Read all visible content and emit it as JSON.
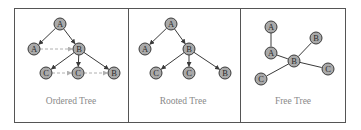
{
  "diagram": {
    "panels": [
      {
        "id": "ordered",
        "title": "Ordered Tree",
        "nodes": [
          {
            "label": "A",
            "x": 60,
            "y": 24
          },
          {
            "label": "A",
            "x": 34,
            "y": 49
          },
          {
            "label": "B",
            "x": 79,
            "y": 49
          },
          {
            "label": "C",
            "x": 46,
            "y": 73
          },
          {
            "label": "C",
            "x": 78,
            "y": 73
          },
          {
            "label": "B",
            "x": 114,
            "y": 73
          }
        ],
        "edges": [
          {
            "from": 0,
            "to": 1,
            "style": "arrow"
          },
          {
            "from": 0,
            "to": 2,
            "style": "arrow"
          },
          {
            "from": 2,
            "to": 3,
            "style": "arrow"
          },
          {
            "from": 2,
            "to": 4,
            "style": "arrow"
          },
          {
            "from": 2,
            "to": 5,
            "style": "arrow"
          },
          {
            "from": 1,
            "to": 2,
            "style": "dashed-arrow"
          },
          {
            "from": 3,
            "to": 4,
            "style": "dashed-arrow"
          },
          {
            "from": 4,
            "to": 5,
            "style": "dashed-arrow"
          }
        ]
      },
      {
        "id": "rooted",
        "title": "Rooted Tree",
        "nodes": [
          {
            "label": "A",
            "x": 171,
            "y": 24
          },
          {
            "label": "A",
            "x": 145,
            "y": 49
          },
          {
            "label": "B",
            "x": 189,
            "y": 49
          },
          {
            "label": "C",
            "x": 156,
            "y": 73
          },
          {
            "label": "C",
            "x": 189,
            "y": 73
          },
          {
            "label": "B",
            "x": 225,
            "y": 73
          }
        ],
        "edges": [
          {
            "from": 0,
            "to": 1,
            "style": "arrow"
          },
          {
            "from": 0,
            "to": 2,
            "style": "arrow"
          },
          {
            "from": 2,
            "to": 3,
            "style": "arrow"
          },
          {
            "from": 2,
            "to": 4,
            "style": "arrow"
          },
          {
            "from": 2,
            "to": 5,
            "style": "arrow"
          }
        ]
      },
      {
        "id": "free",
        "title": "Free Tree",
        "nodes": [
          {
            "label": "A",
            "x": 271,
            "y": 27
          },
          {
            "label": "A",
            "x": 271,
            "y": 53
          },
          {
            "label": "B",
            "x": 294,
            "y": 61
          },
          {
            "label": "B",
            "x": 316,
            "y": 38
          },
          {
            "label": "C",
            "x": 261,
            "y": 79
          },
          {
            "label": "C",
            "x": 328,
            "y": 69
          }
        ],
        "edges": [
          {
            "from": 0,
            "to": 1,
            "style": "line"
          },
          {
            "from": 1,
            "to": 2,
            "style": "line"
          },
          {
            "from": 2,
            "to": 3,
            "style": "line"
          },
          {
            "from": 2,
            "to": 4,
            "style": "line"
          },
          {
            "from": 2,
            "to": 5,
            "style": "line"
          }
        ]
      }
    ],
    "colors": {
      "node_fill": "#a9a9a9",
      "node_stroke": "#3a3a3a",
      "edge": "#3a3a3a",
      "dashed_edge": "#b0b0b0",
      "border": "#555555",
      "label": "#8a8a8a"
    }
  }
}
